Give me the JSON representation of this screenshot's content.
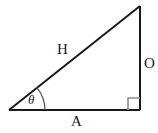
{
  "figure": {
    "kind": "right-triangle-trigonometry-diagram",
    "background_color": "#ffffff",
    "stroke_color": "#1a1a1a",
    "marker_color": "#8c8c8c",
    "labels": {
      "hypotenuse": "H",
      "opposite": "O",
      "adjacent": "A",
      "angle": "θ"
    },
    "geometry": {
      "vertex_left": [
        9,
        110
      ],
      "vertex_bottom_right": [
        140,
        110
      ],
      "vertex_top_right": [
        140,
        6
      ],
      "angle_arc_radius": 36,
      "right_angle_marker_size": 12
    }
  }
}
